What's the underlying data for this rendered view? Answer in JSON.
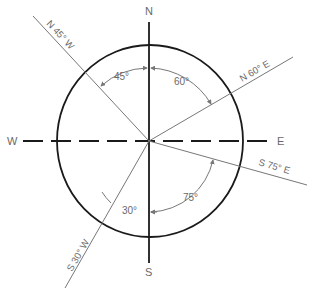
{
  "diagram": {
    "colors": {
      "circle": "#1a1a1a",
      "axis": "#1a1a1a",
      "bearing_line": "#777777",
      "text": "#6a6a6a"
    },
    "cardinals": {
      "north": "N",
      "south": "S",
      "east": "E",
      "west": "W"
    },
    "bearings": [
      {
        "label": "N 45° W",
        "angle_label": "45°"
      },
      {
        "label": "N 60° E",
        "angle_label": "60°"
      },
      {
        "label": "S 75° E",
        "angle_label": "75°"
      },
      {
        "label": "S 30° W",
        "angle_label": "30°"
      }
    ]
  }
}
